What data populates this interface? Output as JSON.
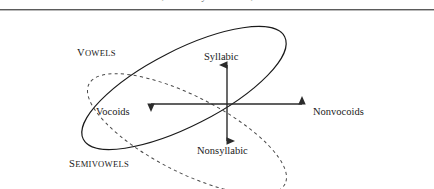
{
  "caption": {
    "text": "nonvocoids, whether syllabic or not, are consonantal."
  },
  "diagram": {
    "type": "venn-cross-diagram",
    "axes": {
      "up_label": "Syllabic",
      "down_label": "Nonsyllabic",
      "left_label": "Vocoids",
      "right_label": "Nonvocoids",
      "origin": {
        "x": 227,
        "y": 90
      }
    },
    "regions": [
      {
        "name": "vowels",
        "label": "Vowels",
        "label_caps": "V",
        "label_rest": "OWELS",
        "stroke": "solid",
        "color": "#1a1a1a"
      },
      {
        "name": "semivowels",
        "label": "Semivowels",
        "label_caps": "S",
        "label_rest": "EMIVOWELS",
        "stroke": "dashed",
        "color": "#4a4a4a"
      }
    ],
    "colors": {
      "ink": "#1a1a1a",
      "dashed_ink": "#4a4a4a",
      "rule": "#5b5b5b",
      "background": "#ffffff"
    }
  }
}
